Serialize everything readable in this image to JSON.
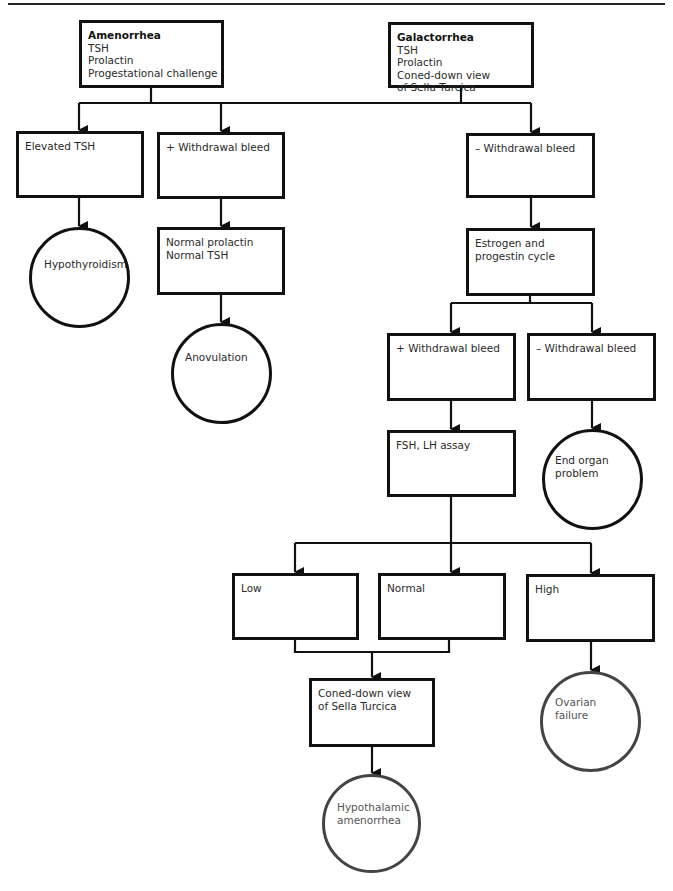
{
  "diagram": {
    "nodes": {
      "amenorrhea": {
        "title": "Amenorrhea",
        "lines": [
          "TSH",
          "Prolactin",
          "Progestational challenge"
        ]
      },
      "galactorrhea": {
        "title": "Galactorrhea",
        "lines": [
          "TSH",
          "Prolactin",
          "Coned-down view",
          "of Sella Turcica"
        ]
      },
      "elevated_tsh": {
        "lines": [
          "Elevated TSH"
        ]
      },
      "plus_withdrawal_1": {
        "lines": [
          "+ Withdrawal bleed"
        ]
      },
      "minus_withdrawal_1": {
        "lines": [
          "– Withdrawal bleed"
        ]
      },
      "hypothyroidism": {
        "lines": [
          "Hypothyroidism"
        ]
      },
      "normal_prolactin_tsh": {
        "lines": [
          "Normal prolactin",
          "Normal TSH"
        ]
      },
      "anovulation": {
        "lines": [
          "Anovulation"
        ]
      },
      "estrogen_progestin": {
        "lines": [
          "Estrogen and",
          "progestin cycle"
        ]
      },
      "plus_withdrawal_2": {
        "lines": [
          "+ Withdrawal bleed"
        ]
      },
      "minus_withdrawal_2": {
        "lines": [
          "– Withdrawal bleed"
        ]
      },
      "fsh_lh": {
        "lines": [
          "FSH, LH assay"
        ]
      },
      "end_organ": {
        "lines": [
          "End organ",
          "problem"
        ]
      },
      "low": {
        "lines": [
          "Low"
        ]
      },
      "normal": {
        "lines": [
          "Normal"
        ]
      },
      "high": {
        "lines": [
          "High"
        ]
      },
      "coned_down": {
        "lines": [
          "Coned-down view",
          "of Sella Turcica"
        ]
      },
      "ovarian_failure": {
        "lines": [
          "Ovarian",
          "failure"
        ]
      },
      "hypothalamic": {
        "lines": [
          "Hypothalamic",
          "amenorrhea"
        ]
      }
    },
    "colors": {
      "stroke": "#111111",
      "gray_stroke": "#444444",
      "text": "#2a2a2a",
      "gray_text": "#555555"
    }
  }
}
